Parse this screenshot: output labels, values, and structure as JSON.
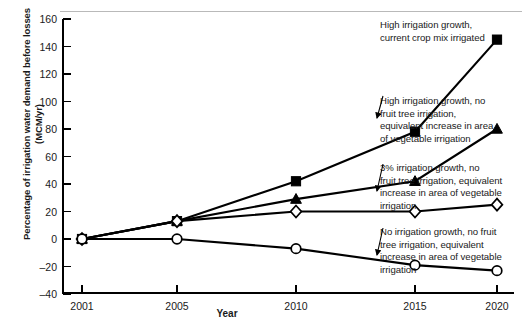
{
  "chart_data": {
    "type": "line",
    "title": "",
    "xlabel": "Year",
    "ylabel": "Percentage of irrigation water demand before losses (MCM/yr)",
    "categories": [
      "2001",
      "2005",
      "2010",
      "2015",
      "2020"
    ],
    "x": [
      2001,
      2005,
      2010,
      2015,
      2020
    ],
    "xlim": [
      2001,
      2020
    ],
    "ylim": [
      -40,
      160
    ],
    "yticks": [
      -40,
      -20,
      0,
      20,
      40,
      60,
      80,
      100,
      120,
      140,
      160
    ],
    "ytick_labels": [
      "-40",
      "-20",
      "0",
      "20",
      "40",
      "60",
      "80",
      "100",
      "120",
      "140",
      "160"
    ],
    "grid": false,
    "legend_position": "annotations-right",
    "series": [
      {
        "name": "High irrigation growth, current crop mix irrigated",
        "marker": "filled-square",
        "values": [
          0,
          13,
          42,
          78,
          145
        ]
      },
      {
        "name": "High irrigation growth, no fruit tree irrigation, equivalent increase in area of vegetable irrigation",
        "marker": "filled-triangle",
        "values": [
          0,
          13,
          29,
          42,
          80
        ]
      },
      {
        "name": "3% irrigation growth, no fruit tree irrigation, equivalent increase in area of vegetable irrigation",
        "marker": "open-diamond",
        "values": [
          0,
          13,
          20,
          20,
          25
        ]
      },
      {
        "name": "No irrigation growth, no fruit tree irrigation, equivalent increase in area of vegetable irrigation",
        "marker": "open-circle",
        "values": [
          0,
          0,
          -7,
          -19,
          -23
        ]
      }
    ],
    "annotations": [
      "High irrigation growth,\ncurrent crop mix irrigated",
      "High irrigation growth, no\nfruit tree irrigation,\nequivalent increase in area\nof vegetable irrigation",
      "3% irrigation growth, no\nfruit tree irrigation, equivalent\nincrease in area of vegetable\nirrigation",
      "No irrigation growth, no fruit\ntree irrigation, equivalent\nincrease in area of vegetable\nirrigation"
    ]
  },
  "colors": {
    "ink": "#000000",
    "text": "#1a1a1a",
    "background": "#ffffff",
    "rule": "#b9b9b9"
  }
}
